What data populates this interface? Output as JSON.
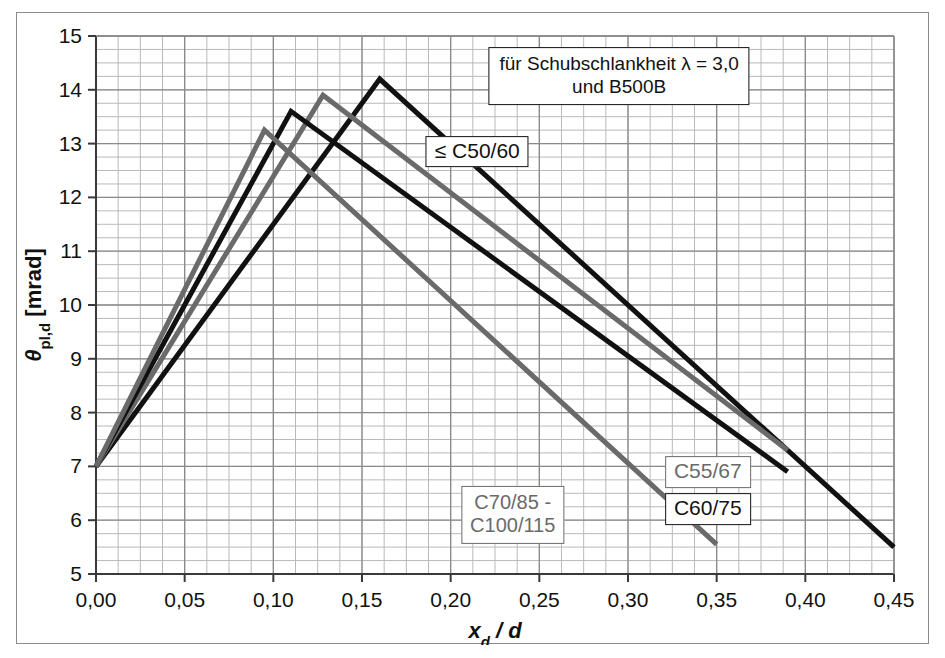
{
  "figure": {
    "axis": {
      "x_title_main": "x",
      "x_title_sub": "d",
      "x_title_tail": " / d",
      "y_title_main": "θ",
      "y_title_sub": "pl,d",
      "y_title_tail": " [mrad]",
      "x_ticks": [
        "0,00",
        "0,05",
        "0,10",
        "0,15",
        "0,20",
        "0,25",
        "0,30",
        "0,35",
        "0,40",
        "0,45"
      ],
      "y_ticks": [
        "5",
        "6",
        "7",
        "8",
        "9",
        "10",
        "11",
        "12",
        "13",
        "14",
        "15"
      ]
    },
    "annotations": {
      "condition_box": "für Schubschlankheit λ = 3,0\nund B500B",
      "label_c50": "≤ C50/60",
      "label_c55": "C55/67",
      "label_c60": "C60/75",
      "label_c70": "C70/85 -\nC100/115"
    },
    "colors": {
      "black_curve": "#111111",
      "gray_curve": "#6a6a6a",
      "grid_minor": "#b9b9b9",
      "grid_major": "#8a8a8a",
      "axis": "#555555",
      "background": "#ffffff"
    }
  },
  "chart_data": {
    "type": "line",
    "title": "",
    "subtitle": "für Schubschlankheit λ = 3,0 und B500B",
    "xlabel": "x_d / d",
    "ylabel": "θ_pl,d [mrad]",
    "xlim": [
      0.0,
      0.45
    ],
    "ylim": [
      5,
      15
    ],
    "x_major_step": 0.05,
    "x_minor_step": 0.0125,
    "y_major_step": 1,
    "y_minor_step": 0.25,
    "grid": true,
    "legend": "inline-callouts",
    "series": [
      {
        "name": "≤ C50/60",
        "color": "#111111",
        "width": 5,
        "points": [
          [
            0.0,
            7.0
          ],
          [
            0.16,
            14.2
          ],
          [
            0.45,
            5.5
          ]
        ]
      },
      {
        "name": "C55/67",
        "color": "#6a6a6a",
        "width": 5,
        "points": [
          [
            0.0,
            7.0
          ],
          [
            0.128,
            13.9
          ],
          [
            0.39,
            7.3
          ]
        ]
      },
      {
        "name": "C60/75",
        "color": "#111111",
        "width": 5,
        "points": [
          [
            0.0,
            7.0
          ],
          [
            0.11,
            13.6
          ],
          [
            0.39,
            6.9
          ]
        ]
      },
      {
        "name": "C70/85 - C100/115",
        "color": "#6a6a6a",
        "width": 5,
        "points": [
          [
            0.0,
            7.0
          ],
          [
            0.095,
            13.25
          ],
          [
            0.35,
            5.55
          ]
        ]
      }
    ]
  }
}
